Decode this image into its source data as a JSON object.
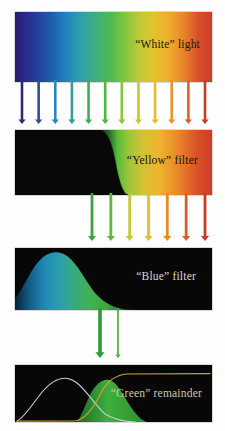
{
  "figure": {
    "background_color": "#ffffff",
    "width": 225,
    "height": 431
  },
  "panels": [
    {
      "id": "white-light",
      "label": "“White” light",
      "label_color": "#17160f",
      "description": "Full visible spectrum band, violet through red",
      "curve": "flat-full",
      "spectrum_stops": [
        {
          "pos": 0,
          "color": "#2b1a6b"
        },
        {
          "pos": 6,
          "color": "#2a2d8f"
        },
        {
          "pos": 16,
          "color": "#1d52a8"
        },
        {
          "pos": 25,
          "color": "#1f7fbe"
        },
        {
          "pos": 33,
          "color": "#2e9fae"
        },
        {
          "pos": 41,
          "color": "#3fae7d"
        },
        {
          "pos": 49,
          "color": "#4fba4c"
        },
        {
          "pos": 56,
          "color": "#86c53f"
        },
        {
          "pos": 63,
          "color": "#bccb36"
        },
        {
          "pos": 70,
          "color": "#e0c42f"
        },
        {
          "pos": 78,
          "color": "#efae2c"
        },
        {
          "pos": 86,
          "color": "#e8822a"
        },
        {
          "pos": 93,
          "color": "#d8502a"
        },
        {
          "pos": 100,
          "color": "#cc3b28"
        }
      ]
    },
    {
      "id": "yellow-filter",
      "label": "“Yellow” filter",
      "label_color": "#15140c",
      "description": "Long-pass transmission: blocks blue/violet, passes green through red",
      "curve": "long-pass",
      "background_color": "#080808"
    },
    {
      "id": "blue-filter",
      "label": "“Blue” filter",
      "label_color": "#d8d8d8",
      "description": "Band-pass transmission peaking in the blue, tailing into green",
      "curve": "band-pass-blue",
      "background_color": "#070707"
    },
    {
      "id": "green-remainder",
      "label": "“Green” remainder",
      "label_color": "#cfc9a2",
      "description": "Overlap of the blue band-pass and yellow long-pass leaves only green",
      "curve": "overlap-green",
      "background_color": "#070707"
    }
  ],
  "arrow_groups": [
    {
      "id": "white-to-yellow",
      "count": 12,
      "description": "Full spectrum of rays striking the yellow filter",
      "colors": [
        "#27306f",
        "#2a4f94",
        "#2a86bc",
        "#339d9b",
        "#3cae64",
        "#4cb83f",
        "#8cc43c",
        "#c3c936",
        "#e5bb2f",
        "#e9932b",
        "#dd6128",
        "#cd3b26"
      ]
    },
    {
      "id": "yellow-to-blue",
      "count": 7,
      "description": "Only green through red survive the yellow filter",
      "colors": [
        "#3da33e",
        "#5fb73c",
        "#c5c936",
        "#e7bb2f",
        "#e28b2a",
        "#d55f28",
        "#c93a26"
      ]
    },
    {
      "id": "blue-to-green",
      "count": 2,
      "description": "Narrow green band passing to the final panel",
      "colors": [
        "#2e9b3a",
        "#58ad45"
      ]
    }
  ],
  "annotations": {
    "quote_style": "curly double quotes around filter colour names"
  }
}
